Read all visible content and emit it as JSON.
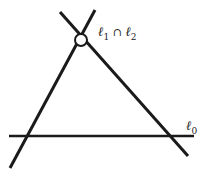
{
  "diagram": {
    "lines": [
      {
        "id": "l1",
        "x1": 10,
        "y1": 168,
        "x2": 95,
        "y2": 10
      },
      {
        "id": "l2",
        "x1": 60,
        "y1": 12,
        "x2": 188,
        "y2": 156
      },
      {
        "id": "l0",
        "x1": 9,
        "y1": 136,
        "x2": 194,
        "y2": 136
      }
    ],
    "intersection_point": {
      "cx": 81,
      "cy": 40,
      "r": 6
    },
    "labels": {
      "intersection": {
        "base1": "ℓ",
        "sub1": "1",
        "op": " ∩ ",
        "base2": "ℓ",
        "sub2": "2"
      },
      "l0": {
        "base": "ℓ",
        "sub": "0"
      }
    },
    "colors": {
      "stroke": "#1a1a1a",
      "background": "#ffffff"
    }
  }
}
